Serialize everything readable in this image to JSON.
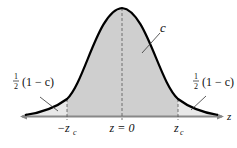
{
  "diagram": {
    "type": "standard-normal-distribution",
    "center_label": "c",
    "left_tail_label": {
      "fraction": "1/2",
      "frac_num": "1",
      "frac_den": "2",
      "expr": "(1 − c)"
    },
    "right_tail_label": {
      "fraction": "1/2",
      "frac_num": "1",
      "frac_den": "2",
      "expr": "(1 − c)"
    },
    "axis_label": "z",
    "ticks": [
      {
        "label": "−z",
        "sub": "c"
      },
      {
        "label": "z = 0"
      },
      {
        "label": "z",
        "sub": "c"
      }
    ],
    "colors": {
      "center_fill": "#cfcfcf",
      "tail_fill": "#e8e8e8",
      "curve": "#000000",
      "axis": "#888888"
    }
  }
}
